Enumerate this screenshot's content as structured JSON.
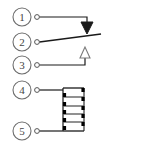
{
  "diagram": {
    "type": "electrical-schematic",
    "background_color": "#ffffff",
    "line_color": "#1a1a1a",
    "label_color": "#444444",
    "terminal_fill": "#ffffff",
    "pins": [
      {
        "number": "1",
        "circle_cx": 22,
        "circle_cy": 17,
        "circle_r": 9,
        "terminal_cx": 37,
        "terminal_cy": 17,
        "terminal_r": 2.4,
        "name": "pin-1",
        "role": "normally-open-contact"
      },
      {
        "number": "2",
        "circle_cx": 22,
        "circle_cy": 42,
        "circle_r": 9,
        "terminal_cx": 37,
        "terminal_cy": 42,
        "terminal_r": 2.4,
        "name": "pin-2",
        "role": "common-contact"
      },
      {
        "number": "3",
        "circle_cx": 22,
        "circle_cy": 65,
        "circle_r": 9,
        "terminal_cx": 37,
        "terminal_cy": 65,
        "terminal_r": 2.4,
        "name": "pin-3",
        "role": "normally-closed-contact"
      },
      {
        "number": "4",
        "circle_cx": 22,
        "circle_cy": 90,
        "circle_r": 9,
        "terminal_cx": 37,
        "terminal_cy": 90,
        "terminal_r": 2.4,
        "name": "pin-4",
        "role": "coil-terminal-a"
      },
      {
        "number": "5",
        "circle_cx": 22,
        "circle_cy": 131,
        "circle_r": 9,
        "terminal_cx": 37,
        "terminal_cy": 131,
        "terminal_r": 2.4,
        "name": "pin-5",
        "role": "coil-terminal-b"
      }
    ],
    "arrows": [
      {
        "name": "filled-down-arrow",
        "style": "filled",
        "direction": "down",
        "x": 87,
        "tip_y": 33,
        "half_width": 6,
        "height": 11
      },
      {
        "name": "outline-up-arrow",
        "style": "outline",
        "direction": "up",
        "x": 85,
        "tip_y": 48,
        "half_width": 5,
        "height": 10
      }
    ],
    "coil": {
      "name": "coil-winding",
      "left_x": 62,
      "right_x": 84,
      "top_y": 88,
      "bottom_y": 131,
      "turn_count": 5,
      "turn_spacing": 9
    },
    "wires": [
      {
        "name": "wire-pin-1",
        "path": "M 39.4 17 L 87 17 L 87 26"
      },
      {
        "name": "wire-pin-2",
        "path": "M 39.4 42 L 101 34"
      },
      {
        "name": "wire-pin-3",
        "path": "M 39.4 65 L 85 65 L 85 50"
      },
      {
        "name": "wire-pin-4",
        "path": "M 39.4 90 L 62 90"
      },
      {
        "name": "wire-pin-5",
        "path": "M 39.4 131 L 62 131"
      }
    ]
  }
}
